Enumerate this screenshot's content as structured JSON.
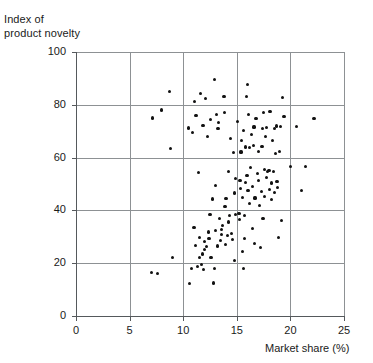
{
  "chart_data": {
    "type": "scatter",
    "title": "",
    "xlabel": "Market share (%)",
    "ylabel": "Index of\nproduct novelty",
    "ylabel_lines": [
      "Index of",
      "product novelty"
    ],
    "xlim": [
      0,
      25
    ],
    "ylim": [
      0,
      100
    ],
    "xticks": [
      0,
      5,
      10,
      15,
      20,
      25
    ],
    "yticks": [
      0,
      20,
      40,
      60,
      80,
      100
    ],
    "xtick_labels": [
      "0",
      "5",
      "10",
      "15",
      "20",
      "25"
    ],
    "ytick_labels": [
      "0",
      "20",
      "40",
      "60",
      "80",
      "100"
    ],
    "grid": true,
    "grid_color": "#8d9194",
    "axis_color": "#55595c",
    "marker_color": "#111111",
    "marker_size": 3.2,
    "legend": null,
    "n_points": 150,
    "points": [
      [
        7.05,
        16.4
      ],
      [
        7.6,
        16.2
      ],
      [
        7.15,
        75.0
      ],
      [
        8.0,
        78.0
      ],
      [
        8.7,
        85.0
      ],
      [
        8.85,
        63.5
      ],
      [
        9.0,
        22.1
      ],
      [
        10.5,
        71.2
      ],
      [
        10.75,
        18.0
      ],
      [
        10.6,
        12.3
      ],
      [
        10.9,
        69.4
      ],
      [
        11.0,
        33.6
      ],
      [
        11.05,
        81.2
      ],
      [
        11.15,
        26.8
      ],
      [
        11.2,
        75.8
      ],
      [
        11.35,
        18.6
      ],
      [
        11.4,
        54.2
      ],
      [
        11.5,
        22.3
      ],
      [
        11.55,
        29.6
      ],
      [
        11.6,
        84.2
      ],
      [
        11.7,
        19.6
      ],
      [
        11.8,
        23.5
      ],
      [
        11.85,
        72.1
      ],
      [
        11.9,
        17.6
      ],
      [
        11.95,
        28.3
      ],
      [
        12.0,
        25.3
      ],
      [
        12.1,
        82.3
      ],
      [
        12.2,
        26.2
      ],
      [
        12.3,
        68.0
      ],
      [
        12.35,
        31.8
      ],
      [
        12.4,
        29.3
      ],
      [
        12.5,
        38.4
      ],
      [
        12.55,
        74.5
      ],
      [
        12.6,
        22.2
      ],
      [
        12.7,
        44.3
      ],
      [
        12.8,
        12.5
      ],
      [
        12.9,
        89.6
      ],
      [
        12.95,
        18.1
      ],
      [
        13.0,
        49.3
      ],
      [
        13.05,
        32.5
      ],
      [
        13.1,
        76.3
      ],
      [
        13.2,
        26.5
      ],
      [
        13.25,
        70.9
      ],
      [
        13.3,
        73.2
      ],
      [
        13.4,
        36.9
      ],
      [
        13.5,
        28.5
      ],
      [
        13.55,
        30.8
      ],
      [
        13.6,
        32.9
      ],
      [
        13.7,
        34.4
      ],
      [
        13.8,
        83.1
      ],
      [
        13.85,
        77.0
      ],
      [
        13.9,
        41.5
      ],
      [
        13.95,
        27.2
      ],
      [
        14.0,
        44.6
      ],
      [
        14.1,
        30.6
      ],
      [
        14.2,
        35.6
      ],
      [
        14.25,
        54.6
      ],
      [
        14.3,
        38.2
      ],
      [
        14.4,
        67.2
      ],
      [
        14.5,
        31.4
      ],
      [
        14.6,
        29.0
      ],
      [
        14.7,
        62.0
      ],
      [
        14.75,
        46.6
      ],
      [
        14.8,
        20.9
      ],
      [
        14.85,
        38.5
      ],
      [
        14.9,
        52.0
      ],
      [
        15.1,
        73.6
      ],
      [
        15.2,
        38.7
      ],
      [
        15.25,
        36.6
      ],
      [
        15.3,
        51.4
      ],
      [
        15.35,
        48.3
      ],
      [
        15.4,
        62.1
      ],
      [
        15.45,
        66.4
      ],
      [
        15.5,
        24.3
      ],
      [
        15.55,
        45.0
      ],
      [
        15.6,
        18.0
      ],
      [
        15.65,
        70.3
      ],
      [
        15.7,
        29.4
      ],
      [
        15.75,
        38.1
      ],
      [
        15.8,
        50.6
      ],
      [
        15.85,
        64.0
      ],
      [
        15.9,
        83.1
      ],
      [
        15.95,
        53.2
      ],
      [
        16.0,
        87.8
      ],
      [
        16.05,
        47.6
      ],
      [
        16.1,
        76.3
      ],
      [
        16.15,
        63.8
      ],
      [
        16.2,
        42.5
      ],
      [
        16.3,
        56.2
      ],
      [
        16.4,
        68.9
      ],
      [
        16.45,
        49.2
      ],
      [
        16.5,
        33.1
      ],
      [
        16.55,
        64.6
      ],
      [
        16.6,
        71.6
      ],
      [
        16.65,
        27.5
      ],
      [
        16.7,
        44.7
      ],
      [
        16.8,
        74.9
      ],
      [
        16.9,
        53.9
      ],
      [
        17.0,
        51.2
      ],
      [
        17.05,
        62.4
      ],
      [
        17.1,
        41.8
      ],
      [
        17.2,
        25.8
      ],
      [
        17.3,
        47.3
      ],
      [
        17.35,
        64.2
      ],
      [
        17.4,
        70.9
      ],
      [
        17.45,
        36.8
      ],
      [
        17.5,
        77.0
      ],
      [
        17.55,
        55.5
      ],
      [
        17.6,
        45.2
      ],
      [
        17.7,
        68.0
      ],
      [
        17.75,
        52.4
      ],
      [
        17.8,
        71.3
      ],
      [
        17.9,
        54.8
      ],
      [
        18.0,
        55.0
      ],
      [
        18.05,
        48.0
      ],
      [
        18.1,
        77.6
      ],
      [
        18.2,
        44.2
      ],
      [
        18.25,
        50.4
      ],
      [
        18.3,
        66.5
      ],
      [
        18.4,
        54.6
      ],
      [
        18.5,
        71.0
      ],
      [
        18.55,
        46.9
      ],
      [
        18.6,
        61.4
      ],
      [
        18.7,
        72.0
      ],
      [
        18.75,
        50.8
      ],
      [
        18.8,
        48.6
      ],
      [
        18.9,
        29.8
      ],
      [
        19.0,
        62.2
      ],
      [
        19.1,
        71.8
      ],
      [
        19.2,
        36.2
      ],
      [
        19.25,
        82.8
      ],
      [
        19.4,
        75.5
      ],
      [
        20.0,
        56.7
      ],
      [
        20.6,
        71.9
      ],
      [
        21.0,
        47.5
      ],
      [
        21.4,
        56.6
      ],
      [
        22.2,
        74.9
      ]
    ]
  },
  "figure": {
    "background": "#ffffff",
    "plot_left_px": 76,
    "plot_top_px": 52,
    "plot_width_px": 268,
    "plot_height_px": 264
  }
}
